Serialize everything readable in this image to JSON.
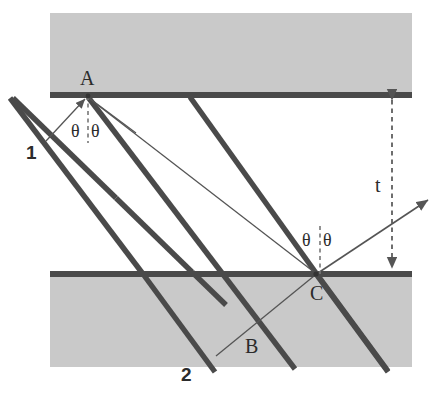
{
  "figure": {
    "colors": {
      "medium_fill": "#c9c9c9",
      "interface_bar": "#4a4a4a",
      "ray_thick": "#4a4a4a",
      "ray_thin": "#555555",
      "label_text": "#2b2b2b",
      "background": "#ffffff"
    },
    "geometry": {
      "slab_left_x": 50,
      "slab_right_x": 412,
      "top_band_y": 13,
      "top_interface_y": 95,
      "bottom_interface_y": 274,
      "bottom_band_bottom_y": 367,
      "point_A": [
        88,
        96
      ],
      "point_C": [
        316,
        274
      ],
      "film_thickness_x": 392
    }
  },
  "labels": {
    "point_a": "A",
    "point_b": "B",
    "point_c": "C",
    "ray_one": "1",
    "ray_two": "2",
    "thickness": "t",
    "theta_a_left": "θ",
    "theta_a_right": "θ",
    "theta_c_left": "θ",
    "theta_c_right": "θ"
  },
  "elements": {
    "top_medium_name": "top-medium-slab",
    "bottom_medium_name": "bottom-medium-slab",
    "film_gap_name": "thin-film-gap",
    "top_interface_name": "top-interface-bar",
    "bottom_interface_name": "bottom-interface-bar",
    "normal_a_name": "normal-line-at-a",
    "normal_c_name": "normal-line-at-c",
    "thickness_arrow_name": "thickness-double-arrow"
  }
}
